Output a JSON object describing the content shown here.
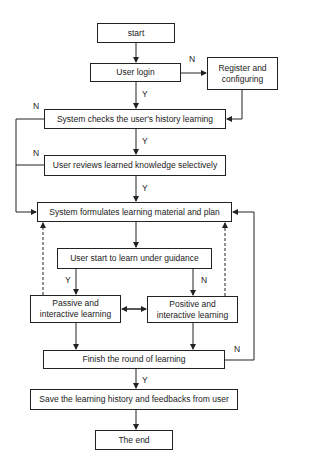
{
  "nodes": {
    "start": "start",
    "login": "User login",
    "register": "Register and configuring",
    "check_history": "System checks the user's history learning",
    "review": "User reviews learned knowledge selectively",
    "formulate": "System  formulates  learning material and plan",
    "start_learn": "User start to learn under guidance",
    "passive": "Passive and interactive learning",
    "positive": "Positive and interactive learning",
    "finish": "Finish the round of learning",
    "save": "Save the learning history and feedbacks from user",
    "end": "The end"
  },
  "edge_labels": {
    "login_no": "N",
    "login_yes": "Y",
    "check_no": "N",
    "check_yes": "Y",
    "review_no": "N",
    "review_yes": "Y",
    "start_learn_yes": "Y",
    "start_learn_no": "N",
    "finish_no": "N",
    "finish_yes": "Y"
  }
}
